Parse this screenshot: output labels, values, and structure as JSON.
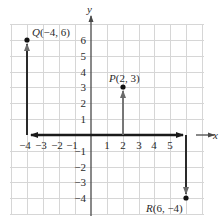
{
  "diagram": {
    "type": "coordinate-plane",
    "x_axis_label": "x",
    "y_axis_label": "y",
    "x_ticks": [
      "-4",
      "-3",
      "-2",
      "-1",
      "1",
      "2",
      "3",
      "4",
      "5"
    ],
    "y_ticks": [
      "6",
      "5",
      "4",
      "3",
      "2",
      "1",
      "-1",
      "-2",
      "-3",
      "-4"
    ],
    "x_range": [
      -4,
      6
    ],
    "y_range": [
      -4,
      6
    ],
    "grid": true,
    "points": [
      {
        "name": "Q",
        "coords": "(-4, 6)",
        "x": -4,
        "y": 6
      },
      {
        "name": "P",
        "coords": "(2, 3)",
        "x": 2,
        "y": 3
      },
      {
        "name": "R",
        "coords": "(6, -4)",
        "x": 6,
        "y": -4
      }
    ],
    "arrows": [
      {
        "description": "along x-axis from origin to x=-4",
        "from": [
          0,
          0
        ],
        "to": [
          -4,
          0
        ]
      },
      {
        "description": "from x=-4 up to Q",
        "from": [
          -4,
          0
        ],
        "to": [
          -4,
          6
        ]
      },
      {
        "description": "along x-axis from origin to x=2",
        "from": [
          0,
          0
        ],
        "to": [
          2,
          0
        ]
      },
      {
        "description": "from x=2 up to P",
        "from": [
          2,
          0
        ],
        "to": [
          2,
          3
        ]
      },
      {
        "description": "along x-axis from origin to x=6",
        "from": [
          0,
          0
        ],
        "to": [
          6,
          0
        ]
      },
      {
        "description": "from x=6 down to R",
        "from": [
          6,
          0
        ],
        "to": [
          6,
          -4
        ]
      }
    ],
    "colors": {
      "grid": "#d6d6d6",
      "axis": "#4a4a4a",
      "arrow_dark": "#1a1a1a",
      "arrow_gray": "#6a6a6a",
      "point": "#111111"
    }
  }
}
